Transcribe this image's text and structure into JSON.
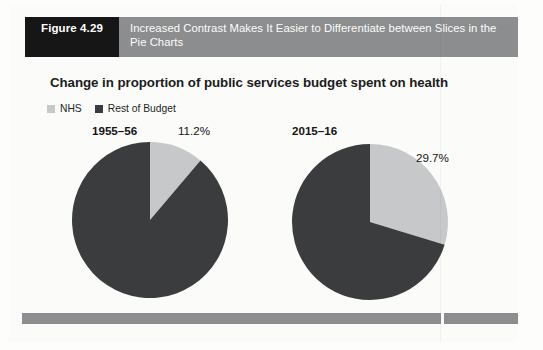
{
  "figure": {
    "number_label": "Figure 4.29",
    "caption": "Increased Contrast Makes It Easier to Differentiate between Slices in the Pie Charts",
    "header_bg": "#8b8d8f",
    "number_box_bg": "#161616"
  },
  "chart_data": {
    "type": "pie",
    "title": "Change in proportion of public services budget spent on health",
    "xlabel": "",
    "ylabel": "",
    "legend": {
      "position": "top-left",
      "entries": [
        {
          "name": "NHS",
          "color": "#c6c8c9"
        },
        {
          "name": "Rest of Budget",
          "color": "#3a3c3e"
        }
      ]
    },
    "charts": [
      {
        "period": "1955–56",
        "categories": [
          "NHS",
          "Rest of Budget"
        ],
        "values": [
          11.2,
          88.8
        ],
        "colors": [
          "#c6c8c9",
          "#3a3c3e"
        ],
        "data_label": "11.2%",
        "start_angle_deg": 0
      },
      {
        "period": "2015–16",
        "categories": [
          "NHS",
          "Rest of Budget"
        ],
        "values": [
          29.7,
          70.3
        ],
        "colors": [
          "#c6c8c9",
          "#3a3c3e"
        ],
        "data_label": "29.7%",
        "start_angle_deg": 0
      }
    ]
  }
}
